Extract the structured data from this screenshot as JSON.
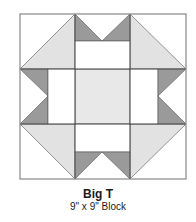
{
  "block": {
    "name": "Big T",
    "size_label": "9\" x 9\" Block"
  },
  "colors": {
    "background": "#ffffff",
    "light": "#e2e2e2",
    "dark": "#9a9a9a",
    "white": "#ffffff",
    "stroke": "#333333",
    "outline": "#888888"
  }
}
